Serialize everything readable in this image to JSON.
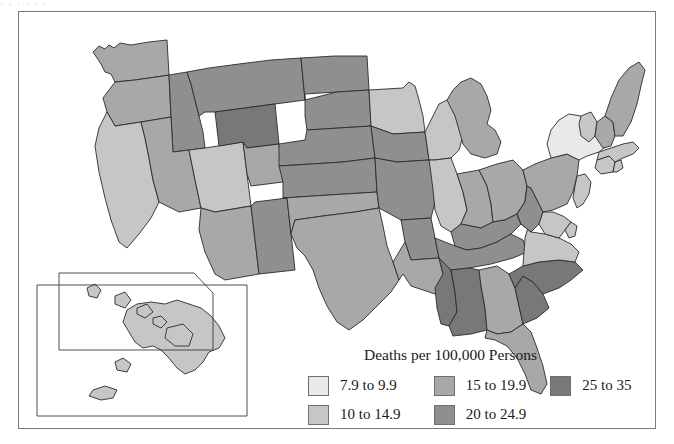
{
  "figure": {
    "cut_text_above": "·    ·     ·           ·      ·   ·",
    "legend_title": "Deaths per 100,000 Persons"
  },
  "legend": {
    "title": "Deaths per 100,000 Persons",
    "classes": [
      {
        "label": "7.9 to 9.9",
        "color": "#e9e9e9"
      },
      {
        "label": "10 to 14.9",
        "color": "#c6c6c6"
      },
      {
        "label": "15 to 19.9",
        "color": "#a8a8a8"
      },
      {
        "label": "20 to 24.9",
        "color": "#8f8f8f"
      },
      {
        "label": "25 to 35",
        "color": "#787878"
      }
    ]
  },
  "map": {
    "projection": "albers-usa",
    "stroke": "#2b2b2b",
    "stroke_width": 0.9,
    "inset_boxes": [
      {
        "name": "hawaii-inset-box"
      },
      {
        "name": "alaska-inset-box"
      }
    ],
    "states": [
      {
        "code": "WA",
        "name": "Washington",
        "class_index": 2,
        "value_range": "15 to 19.9"
      },
      {
        "code": "OR",
        "name": "Oregon",
        "class_index": 2,
        "value_range": "15 to 19.9"
      },
      {
        "code": "CA",
        "name": "California",
        "class_index": 1,
        "value_range": "10 to 14.9"
      },
      {
        "code": "ID",
        "name": "Idaho",
        "class_index": 3,
        "value_range": "20 to 24.9"
      },
      {
        "code": "NV",
        "name": "Nevada",
        "class_index": 2,
        "value_range": "15 to 19.9"
      },
      {
        "code": "UT",
        "name": "Utah",
        "class_index": 1,
        "value_range": "10 to 14.9"
      },
      {
        "code": "AZ",
        "name": "Arizona",
        "class_index": 2,
        "value_range": "15 to 19.9"
      },
      {
        "code": "MT",
        "name": "Montana",
        "class_index": 3,
        "value_range": "20 to 24.9"
      },
      {
        "code": "WY",
        "name": "Wyoming",
        "class_index": 4,
        "value_range": "25 to 35"
      },
      {
        "code": "CO",
        "name": "Colorado",
        "class_index": 2,
        "value_range": "15 to 19.9"
      },
      {
        "code": "NM",
        "name": "New Mexico",
        "class_index": 3,
        "value_range": "20 to 24.9"
      },
      {
        "code": "ND",
        "name": "North Dakota",
        "class_index": 3,
        "value_range": "20 to 24.9"
      },
      {
        "code": "SD",
        "name": "South Dakota",
        "class_index": 3,
        "value_range": "20 to 24.9"
      },
      {
        "code": "NE",
        "name": "Nebraska",
        "class_index": 3,
        "value_range": "20 to 24.9"
      },
      {
        "code": "KS",
        "name": "Kansas",
        "class_index": 3,
        "value_range": "20 to 24.9"
      },
      {
        "code": "OK",
        "name": "Oklahoma",
        "class_index": 2,
        "value_range": "15 to 19.9"
      },
      {
        "code": "TX",
        "name": "Texas",
        "class_index": 2,
        "value_range": "15 to 19.9"
      },
      {
        "code": "MN",
        "name": "Minnesota",
        "class_index": 1,
        "value_range": "10 to 14.9"
      },
      {
        "code": "IA",
        "name": "Iowa",
        "class_index": 3,
        "value_range": "20 to 24.9"
      },
      {
        "code": "MO",
        "name": "Missouri",
        "class_index": 3,
        "value_range": "20 to 24.9"
      },
      {
        "code": "AR",
        "name": "Arkansas",
        "class_index": 3,
        "value_range": "20 to 24.9"
      },
      {
        "code": "LA",
        "name": "Louisiana",
        "class_index": 2,
        "value_range": "15 to 19.9"
      },
      {
        "code": "WI",
        "name": "Wisconsin",
        "class_index": 1,
        "value_range": "10 to 14.9"
      },
      {
        "code": "IL",
        "name": "Illinois",
        "class_index": 1,
        "value_range": "10 to 14.9"
      },
      {
        "code": "MI",
        "name": "Michigan",
        "class_index": 2,
        "value_range": "15 to 19.9"
      },
      {
        "code": "IN",
        "name": "Indiana",
        "class_index": 2,
        "value_range": "15 to 19.9"
      },
      {
        "code": "OH",
        "name": "Ohio",
        "class_index": 2,
        "value_range": "15 to 19.9"
      },
      {
        "code": "KY",
        "name": "Kentucky",
        "class_index": 3,
        "value_range": "20 to 24.9"
      },
      {
        "code": "TN",
        "name": "Tennessee",
        "class_index": 3,
        "value_range": "20 to 24.9"
      },
      {
        "code": "MS",
        "name": "Mississippi",
        "class_index": 4,
        "value_range": "25 to 35"
      },
      {
        "code": "AL",
        "name": "Alabama",
        "class_index": 4,
        "value_range": "25 to 35"
      },
      {
        "code": "GA",
        "name": "Georgia",
        "class_index": 2,
        "value_range": "15 to 19.9"
      },
      {
        "code": "FL",
        "name": "Florida",
        "class_index": 2,
        "value_range": "15 to 19.9"
      },
      {
        "code": "SC",
        "name": "South Carolina",
        "class_index": 4,
        "value_range": "25 to 35"
      },
      {
        "code": "NC",
        "name": "North Carolina",
        "class_index": 4,
        "value_range": "25 to 35"
      },
      {
        "code": "VA",
        "name": "Virginia",
        "class_index": 1,
        "value_range": "10 to 14.9"
      },
      {
        "code": "WV",
        "name": "West Virginia",
        "class_index": 3,
        "value_range": "20 to 24.9"
      },
      {
        "code": "MD",
        "name": "Maryland",
        "class_index": 1,
        "value_range": "10 to 14.9"
      },
      {
        "code": "DE",
        "name": "Delaware",
        "class_index": 1,
        "value_range": "10 to 14.9"
      },
      {
        "code": "PA",
        "name": "Pennsylvania",
        "class_index": 2,
        "value_range": "15 to 19.9"
      },
      {
        "code": "NJ",
        "name": "New Jersey",
        "class_index": 1,
        "value_range": "10 to 14.9"
      },
      {
        "code": "NY",
        "name": "New York",
        "class_index": 0,
        "value_range": "7.9 to 9.9"
      },
      {
        "code": "CT",
        "name": "Connecticut",
        "class_index": 1,
        "value_range": "10 to 14.9"
      },
      {
        "code": "RI",
        "name": "Rhode Island",
        "class_index": 1,
        "value_range": "10 to 14.9"
      },
      {
        "code": "MA",
        "name": "Massachusetts",
        "class_index": 1,
        "value_range": "10 to 14.9"
      },
      {
        "code": "VT",
        "name": "Vermont",
        "class_index": 1,
        "value_range": "10 to 14.9"
      },
      {
        "code": "NH",
        "name": "New Hampshire",
        "class_index": 2,
        "value_range": "15 to 19.9"
      },
      {
        "code": "ME",
        "name": "Maine",
        "class_index": 2,
        "value_range": "15 to 19.9"
      },
      {
        "code": "AK",
        "name": "Alaska",
        "class_index": 1,
        "value_range": "10 to 14.9"
      },
      {
        "code": "HI",
        "name": "Hawaii",
        "class_index": 1,
        "value_range": "10 to 14.9"
      }
    ]
  }
}
